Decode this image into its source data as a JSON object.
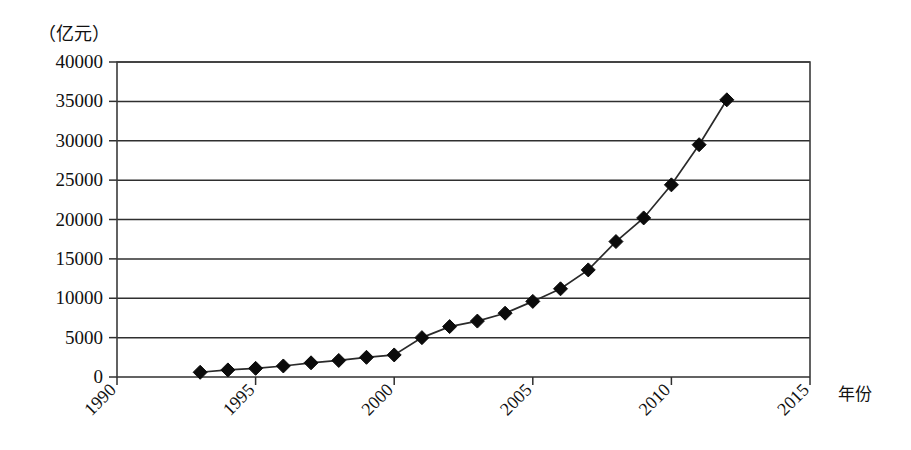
{
  "chart_data": {
    "type": "line",
    "title": "",
    "subtitle": "",
    "unit_label": "（亿元）",
    "xlabel": "年份",
    "ylabel": "",
    "xlim": [
      1990,
      2015
    ],
    "ylim": [
      0,
      40000
    ],
    "grid": true,
    "legend": false,
    "legend_position": "none",
    "marker": "diamond",
    "x_ticks": [
      "1990",
      "1995",
      "2000",
      "2005",
      "2010",
      "2015"
    ],
    "x_tick_values": [
      1990,
      1995,
      2000,
      2005,
      2010,
      2015
    ],
    "x_tick_rotation": -45,
    "y_ticks": [
      "0",
      "5000",
      "10000",
      "15000",
      "20000",
      "25000",
      "30000",
      "35000",
      "40000"
    ],
    "y_tick_values": [
      0,
      5000,
      10000,
      15000,
      20000,
      25000,
      30000,
      35000,
      40000
    ],
    "x": [
      1993,
      1994,
      1995,
      1996,
      1997,
      1998,
      1999,
      2000,
      2001,
      2002,
      2003,
      2004,
      2005,
      2006,
      2007,
      2008,
      2009,
      2010,
      2011,
      2012
    ],
    "values": [
      600,
      900,
      1100,
      1400,
      1800,
      2100,
      2500,
      2800,
      5000,
      6400,
      7100,
      8100,
      9600,
      11200,
      13600,
      17200,
      20200,
      24400,
      29500,
      35200
    ],
    "series": [
      {
        "name": "",
        "x": [
          1993,
          1994,
          1995,
          1996,
          1997,
          1998,
          1999,
          2000,
          2001,
          2002,
          2003,
          2004,
          2005,
          2006,
          2007,
          2008,
          2009,
          2010,
          2011,
          2012
        ],
        "values": [
          600,
          900,
          1100,
          1400,
          1800,
          2100,
          2500,
          2800,
          5000,
          6400,
          7100,
          8100,
          9600,
          11200,
          13600,
          17200,
          20200,
          24400,
          29500,
          35200
        ]
      }
    ]
  },
  "colors": {
    "line": "#2a2a2a",
    "marker": "#0b0b0b",
    "grid": "#2f2f2f",
    "frame": "#3b3b3b",
    "background": "#ffffff"
  }
}
